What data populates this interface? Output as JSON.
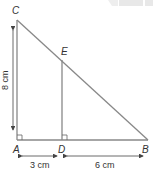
{
  "diagram": {
    "type": "geometry-triangle",
    "points": {
      "A": {
        "label": "A",
        "x": 17,
        "y": 140
      },
      "B": {
        "label": "B",
        "x": 148,
        "y": 140
      },
      "C": {
        "label": "C",
        "x": 17,
        "y": 20
      },
      "D": {
        "label": "D",
        "x": 62,
        "y": 140
      },
      "E": {
        "label": "E",
        "x": 62,
        "y": 60
      }
    },
    "dimensions": {
      "AC": "8 cm",
      "AD": "3 cm",
      "DB": "6 cm"
    },
    "right_angles": [
      "A",
      "D"
    ],
    "colors": {
      "line": "#888888",
      "text": "#333333",
      "watermark": "#e6e6e6"
    }
  }
}
